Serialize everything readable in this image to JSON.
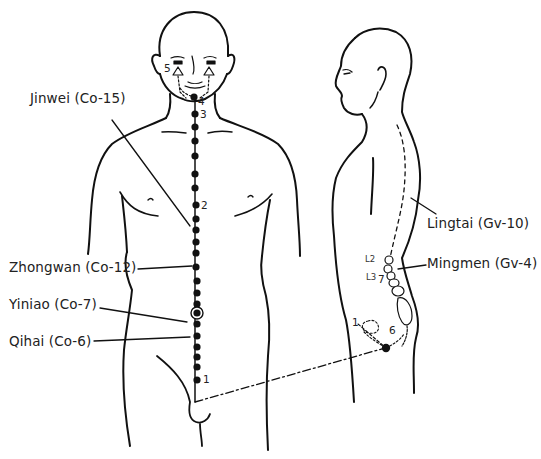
{
  "diagram": {
    "type": "acupuncture point diagram",
    "figures": [
      "front-view-body",
      "side-view-body"
    ],
    "colors": {
      "line": "#111111",
      "background": "#ffffff"
    }
  },
  "labels": {
    "jinwei": "Jinwei (Co-15)",
    "zhongwan": "Zhongwan (Co-12)",
    "yiniao": "Yiniao (Co-7)",
    "qihai": "Qihai (Co-6)",
    "lingtai": "Lingtai (Gv-10)",
    "mingmen": "Mingmen (Gv-4)"
  },
  "markers": {
    "front": {
      "m1": "1",
      "m2": "2",
      "m3": "3",
      "m4": "4",
      "m5": "5"
    },
    "side": {
      "m1": "1",
      "m6": "6",
      "m7": "7",
      "l2": "L2",
      "l3": "L3"
    }
  }
}
